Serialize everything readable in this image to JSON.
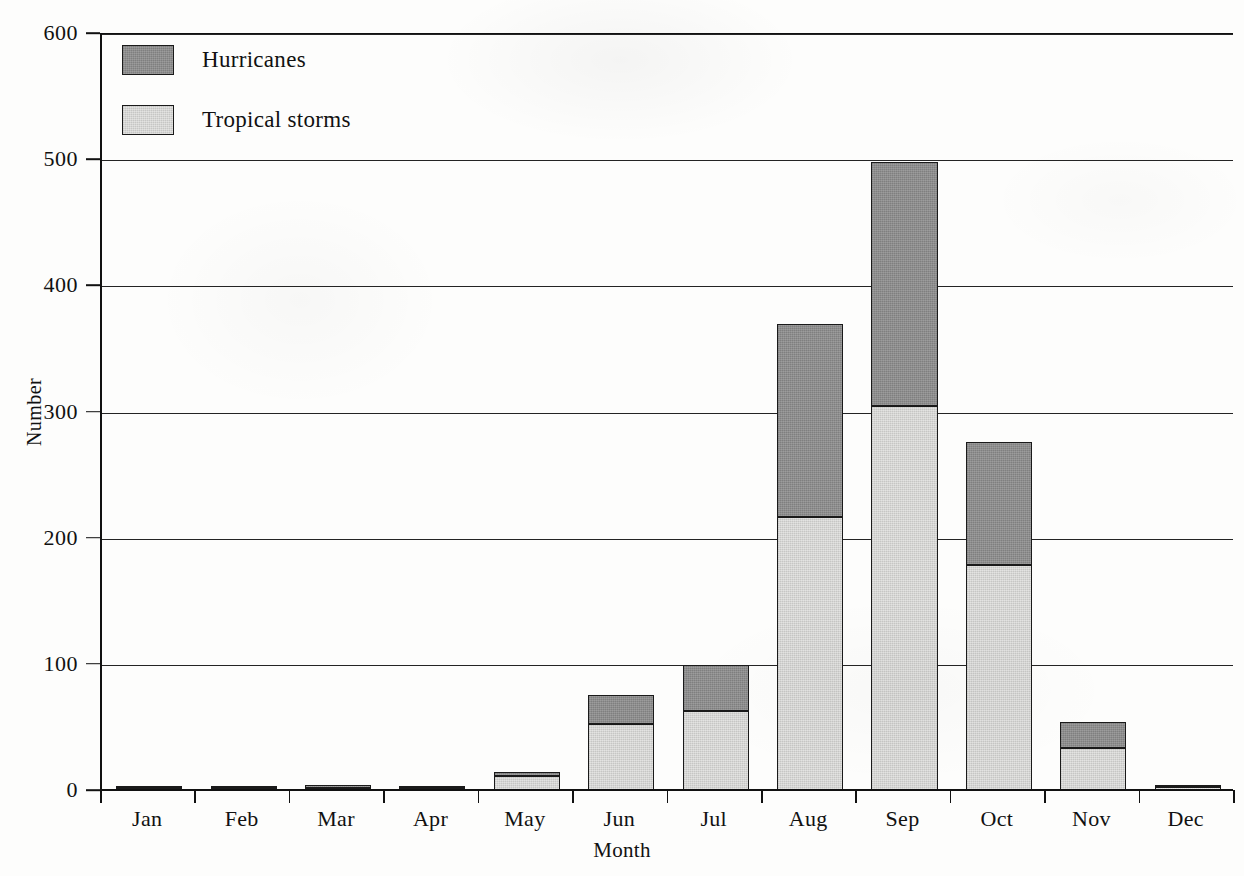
{
  "chart_data": {
    "type": "bar",
    "subtype": "stacked-vertical-bar",
    "title": "",
    "xlabel": "Month",
    "ylabel": "Number",
    "categories": [
      "Jan",
      "Feb",
      "Mar",
      "Apr",
      "May",
      "Jun",
      "Jul",
      "Aug",
      "Sep",
      "Oct",
      "Nov",
      "Dec"
    ],
    "series": [
      {
        "name": "Tropical storms",
        "color": "#d5d5d3",
        "values": [
          1,
          1,
          1,
          1,
          11,
          52,
          63,
          216,
          304,
          178,
          33,
          2
        ]
      },
      {
        "name": "Hurricanes",
        "color": "#8d8d8d",
        "values": [
          1,
          1,
          2,
          1,
          3,
          23,
          36,
          153,
          194,
          98,
          21,
          1
        ]
      }
    ],
    "totals": [
      2,
      2,
      3,
      2,
      14,
      75,
      99,
      369,
      498,
      276,
      54,
      3
    ],
    "ylim": [
      0,
      600
    ],
    "yticks": [
      0,
      100,
      200,
      300,
      400,
      500,
      600
    ],
    "ytick_labels": [
      "0",
      "100",
      "200",
      "300",
      "400",
      "500",
      "600"
    ],
    "grid": "horizontal",
    "legend_position": "top-left",
    "legend_order": [
      "Hurricanes",
      "Tropical storms"
    ]
  },
  "legend": {
    "items": [
      {
        "label": "Hurricanes",
        "color": "#8d8d8d"
      },
      {
        "label": "Tropical storms",
        "color": "#d5d5d3"
      }
    ]
  },
  "axes": {
    "y": {
      "label": "Number",
      "ticks": [
        "0",
        "100",
        "200",
        "300",
        "400",
        "500",
        "600"
      ]
    },
    "x": {
      "label": "Month",
      "ticks": [
        "Jan",
        "Feb",
        "Mar",
        "Apr",
        "May",
        "Jun",
        "Jul",
        "Aug",
        "Sep",
        "Oct",
        "Nov",
        "Dec"
      ]
    }
  }
}
